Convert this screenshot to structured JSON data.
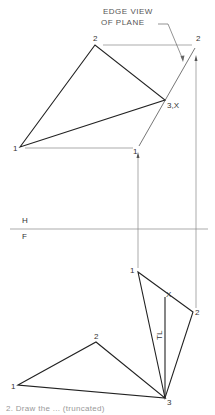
{
  "figure": {
    "annotation": [
      "EDGE VIEW",
      "OF PLANE"
    ],
    "plane_labels": {
      "top": "H",
      "bottom": "F"
    },
    "top_view": {
      "points": [
        {
          "label": "1",
          "x": 20,
          "y": 147
        },
        {
          "label": "2",
          "x": 95,
          "y": 45
        },
        {
          "label": "3,X",
          "x": 165,
          "y": 100
        }
      ],
      "auxiliary_points": [
        {
          "label": "2",
          "x": 195,
          "y": 45
        },
        {
          "label": "1",
          "x": 138,
          "y": 147
        }
      ]
    },
    "front_view": {
      "points": [
        {
          "label": "1",
          "x": 18,
          "y": 385
        },
        {
          "label": "2",
          "x": 96,
          "y": 342
        },
        {
          "label": "3",
          "x": 165,
          "y": 398
        }
      ],
      "auxiliary_points": [
        {
          "label": "1",
          "x": 138,
          "y": 272
        },
        {
          "label": "2",
          "x": 193,
          "y": 312
        },
        {
          "label": "X",
          "x": 165,
          "y": 297
        }
      ],
      "true_length_label": "TL"
    },
    "caption": "2. Draw the ... (truncated)"
  }
}
